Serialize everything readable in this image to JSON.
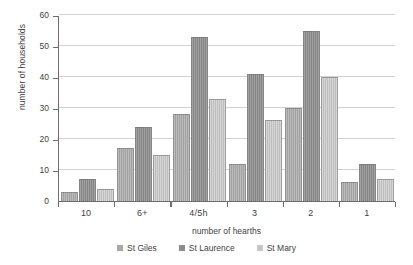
{
  "chart_data": {
    "type": "bar",
    "title": "",
    "xlabel": "number of hearths",
    "ylabel": "number of households",
    "categories": [
      "10",
      "6+",
      "4/5h",
      "3",
      "2",
      "1"
    ],
    "series": [
      {
        "name": "St Giles",
        "color": "#a9a9a9",
        "values": [
          3,
          17,
          28,
          12,
          30,
          6
        ]
      },
      {
        "name": "St Laurence",
        "color": "#8b8b8b",
        "values": [
          7,
          24,
          53,
          41,
          55,
          12
        ]
      },
      {
        "name": "St Mary",
        "color": "#c6c6c6",
        "values": [
          4,
          15,
          33,
          26,
          40,
          7
        ]
      }
    ],
    "ylim": [
      0,
      60
    ],
    "yticks": [
      0,
      10,
      20,
      30,
      40,
      50,
      60
    ],
    "ytick_labels": [
      "0",
      "10",
      "20",
      "30",
      "40",
      "50",
      "60"
    ],
    "grid": true,
    "legend_position": "bottom"
  }
}
